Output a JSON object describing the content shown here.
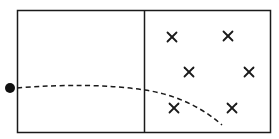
{
  "diagram": {
    "colors": {
      "line": "#1a1a1a",
      "background": "#ffffff"
    },
    "regions": [
      {
        "name": "field-free-region",
        "label": ""
      },
      {
        "name": "magnetic-field-region",
        "label": ""
      }
    ],
    "field_symbol": "×",
    "field_marks": [
      {
        "x": 172,
        "y": 37
      },
      {
        "x": 228,
        "y": 36
      },
      {
        "x": 189,
        "y": 72
      },
      {
        "x": 249,
        "y": 72
      },
      {
        "x": 174,
        "y": 108
      },
      {
        "x": 232,
        "y": 108
      }
    ],
    "particle": {
      "x": 10,
      "y": 88,
      "r": 5
    }
  }
}
